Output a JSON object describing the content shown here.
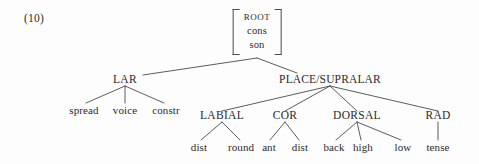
{
  "figure": {
    "example_number": "(10)",
    "background_color": "#fdfdfd",
    "line_color": "#4a4a4a",
    "text_color": "#2b2b2b"
  },
  "tree": {
    "root": {
      "id": "root-matrix",
      "features": [
        "ROOT",
        "cons",
        "son"
      ],
      "feature_root": "ROOT",
      "feature_cons": "cons",
      "feature_son": "son"
    },
    "tiers": {
      "lar": "LAR",
      "place_supralar": "PLACE/SUPRALAR",
      "labial": "LABIAL",
      "cor": "COR",
      "dorsal": "DORSAL",
      "rad": "RAD"
    },
    "leaves": {
      "spread": "spread",
      "voice": "voice",
      "constr": "constr",
      "lab_dist": "dist",
      "lab_round": "round",
      "cor_ant": "ant",
      "cor_dist": "dist",
      "dor_back": "back",
      "dor_high": "high",
      "dor_low": "low",
      "rad_tense": "tense"
    }
  }
}
